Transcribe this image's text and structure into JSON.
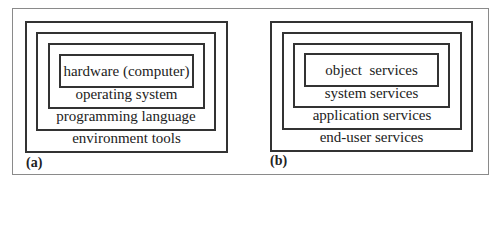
{
  "figure": {
    "panels": [
      {
        "id": "a",
        "label": "(a)",
        "layers_inner_to_outer": [
          "hardware (computer)",
          "operating system",
          "programming language",
          "environment tools"
        ]
      },
      {
        "id": "b",
        "label": "(b)",
        "layers_inner_to_outer": [
          "object  services",
          "system services",
          "application services",
          "end-user services"
        ]
      }
    ]
  }
}
